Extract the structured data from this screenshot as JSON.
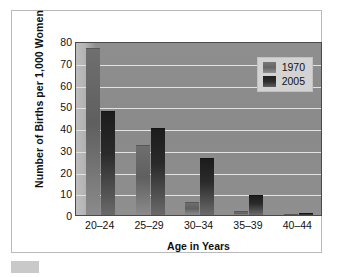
{
  "chart_data": {
    "type": "bar",
    "title": "",
    "categories": [
      "20–24",
      "25–29",
      "30–34",
      "35–39",
      "40–44"
    ],
    "series": [
      {
        "name": "1970",
        "values": [
          77,
          32,
          6,
          2,
          0.3
        ],
        "color": "#666666"
      },
      {
        "name": "2005",
        "values": [
          48,
          40,
          26,
          9,
          1
        ],
        "color": "#222222"
      }
    ],
    "xlabel": "Age in Years",
    "ylabel": "Number of Births per 1,000 Women",
    "ylim": [
      0,
      80
    ],
    "ytick_values": [
      0,
      10,
      20,
      30,
      40,
      50,
      60,
      70,
      80
    ],
    "ytick_labels": [
      "0",
      "10",
      "20",
      "30",
      "40",
      "50",
      "60",
      "70",
      "80"
    ],
    "grid": true,
    "grid_axis": "y",
    "legend_position": "top-right",
    "plot_background": "#8b8b8b",
    "gridline_color": "#e2e2e2"
  },
  "legend": {
    "entries": [
      {
        "label": "1970",
        "swatch": "legend-swatch-1970"
      },
      {
        "label": "2005",
        "swatch": "legend-swatch-2005"
      }
    ]
  },
  "axes": {
    "y_title": "Number of Births per 1,000 Women",
    "x_title": "Age in Years"
  }
}
